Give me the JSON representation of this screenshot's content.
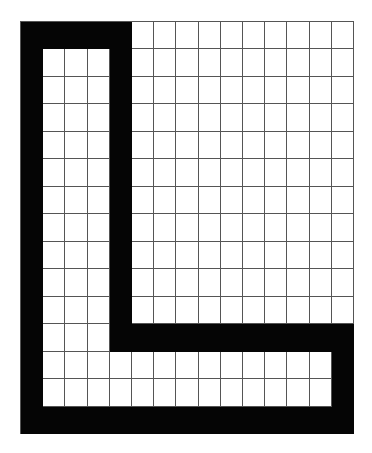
{
  "figure": {
    "rows": 15,
    "cols": 15,
    "fill_color": "#050505",
    "grid_line_color": "#555555",
    "background_color": "#ffffff",
    "filled_cells_legend": "1 = black, 0 = white",
    "cells": [
      [
        1,
        1,
        1,
        1,
        1,
        0,
        0,
        0,
        0,
        0,
        0,
        0,
        0,
        0,
        0
      ],
      [
        1,
        0,
        0,
        0,
        1,
        0,
        0,
        0,
        0,
        0,
        0,
        0,
        0,
        0,
        0
      ],
      [
        1,
        0,
        0,
        0,
        1,
        0,
        0,
        0,
        0,
        0,
        0,
        0,
        0,
        0,
        0
      ],
      [
        1,
        0,
        0,
        0,
        1,
        0,
        0,
        0,
        0,
        0,
        0,
        0,
        0,
        0,
        0
      ],
      [
        1,
        0,
        0,
        0,
        1,
        0,
        0,
        0,
        0,
        0,
        0,
        0,
        0,
        0,
        0
      ],
      [
        1,
        0,
        0,
        0,
        1,
        0,
        0,
        0,
        0,
        0,
        0,
        0,
        0,
        0,
        0
      ],
      [
        1,
        0,
        0,
        0,
        1,
        0,
        0,
        0,
        0,
        0,
        0,
        0,
        0,
        0,
        0
      ],
      [
        1,
        0,
        0,
        0,
        1,
        0,
        0,
        0,
        0,
        0,
        0,
        0,
        0,
        0,
        0
      ],
      [
        1,
        0,
        0,
        0,
        1,
        0,
        0,
        0,
        0,
        0,
        0,
        0,
        0,
        0,
        0
      ],
      [
        1,
        0,
        0,
        0,
        1,
        0,
        0,
        0,
        0,
        0,
        0,
        0,
        0,
        0,
        0
      ],
      [
        1,
        0,
        0,
        0,
        1,
        0,
        0,
        0,
        0,
        0,
        0,
        0,
        0,
        0,
        0
      ],
      [
        1,
        0,
        0,
        0,
        1,
        1,
        1,
        1,
        1,
        1,
        1,
        1,
        1,
        1,
        1
      ],
      [
        1,
        0,
        0,
        0,
        0,
        0,
        0,
        0,
        0,
        0,
        0,
        0,
        0,
        0,
        1
      ],
      [
        1,
        0,
        0,
        0,
        0,
        0,
        0,
        0,
        0,
        0,
        0,
        0,
        0,
        0,
        1
      ],
      [
        1,
        1,
        1,
        1,
        1,
        1,
        1,
        1,
        1,
        1,
        1,
        1,
        1,
        1,
        1
      ]
    ]
  }
}
